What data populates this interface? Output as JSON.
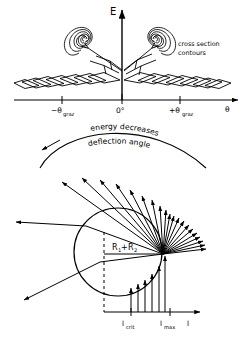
{
  "figure": {
    "stroke_color": "#000000",
    "background_color": "#ffffff"
  },
  "upper_panel": {
    "name": "cross-section-contour-plot",
    "y_axis_label": "E",
    "x_axis_label": "θ",
    "x_ticks": [
      {
        "label": "−θ",
        "sub": "graz",
        "x": 62
      },
      {
        "label": "0°",
        "sub": "",
        "x": 122
      },
      {
        "label": "+θ",
        "sub": "graz",
        "x": 180
      }
    ],
    "annotation": {
      "line1": "cross section",
      "line2": "contours"
    },
    "contour_levels": 6,
    "peaks": [
      {
        "name": "left-peak",
        "theta": "-θ_graz"
      },
      {
        "name": "right-peak",
        "theta": "+θ_graz"
      }
    ]
  },
  "lower_panel": {
    "name": "deflection-angle-diagram",
    "arc_labels": {
      "outer": "energy decreases",
      "inner": "deflection angle"
    },
    "radius_label": {
      "text": "R",
      "sub1": "1",
      "plus": "+",
      "text2": "R",
      "sub2": "2"
    },
    "x_axis_label": "l",
    "x_ticks": [
      {
        "label": "l",
        "sub": "crit",
        "x": 131
      },
      {
        "label": "l",
        "sub": "max",
        "x": 170
      }
    ],
    "ray_count": 22,
    "impact_line_count": 6
  }
}
